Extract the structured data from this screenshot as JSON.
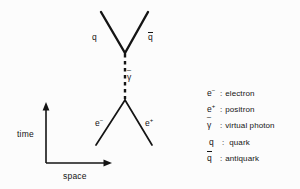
{
  "figure": {
    "type": "feynman-diagram",
    "background_color": "#fcfcfc",
    "line_color": "#141414"
  },
  "axes": {
    "vertical_label": "time",
    "horizontal_label": "space",
    "origin": {
      "x": 46,
      "y": 163
    },
    "vertical_tip": {
      "x": 46,
      "y": 104
    },
    "horizontal_tip": {
      "x": 111,
      "y": 163
    }
  },
  "diagram": {
    "upper_vertex": {
      "x": 125,
      "y": 53
    },
    "lower_vertex": {
      "x": 125,
      "y": 100
    },
    "legs": [
      {
        "name": "quark-leg",
        "label": "q",
        "from": {
          "x": 125,
          "y": 53
        },
        "to": {
          "x": 101,
          "y": 12
        }
      },
      {
        "name": "antiquark-leg",
        "label": "q",
        "overline": true,
        "from": {
          "x": 125,
          "y": 53
        },
        "to": {
          "x": 148,
          "y": 12
        }
      },
      {
        "name": "electron-leg",
        "label": "e",
        "charge": "-",
        "from": {
          "x": 125,
          "y": 100
        },
        "to": {
          "x": 96,
          "y": 145
        }
      },
      {
        "name": "positron-leg",
        "label": "e",
        "charge": "+",
        "from": {
          "x": 125,
          "y": 100
        },
        "to": {
          "x": 152,
          "y": 145
        }
      }
    ],
    "propagator": {
      "name": "virtual-photon-propagator",
      "style": "dashed",
      "label": "y",
      "tilde": true,
      "from": {
        "x": 125,
        "y": 53
      },
      "to": {
        "x": 125,
        "y": 100
      }
    }
  },
  "labels": {
    "quark": "q",
    "antiquark": "q",
    "electron": "e",
    "electron_charge": "−",
    "positron": "e",
    "positron_charge": "+",
    "virtual_photon": "γ"
  },
  "legend": {
    "rows": [
      {
        "symbol": "e",
        "charge": "−",
        "overline": false,
        "tilde": false,
        "separator": ":",
        "description": "electron"
      },
      {
        "symbol": "e",
        "charge": "+",
        "overline": false,
        "tilde": false,
        "separator": ":",
        "description": "positron"
      },
      {
        "symbol": "γ",
        "charge": "",
        "overline": false,
        "tilde": true,
        "separator": ":",
        "description": "virtual photon"
      },
      {
        "symbol": "q",
        "charge": "",
        "overline": false,
        "tilde": false,
        "separator": ":",
        "description": "quark"
      },
      {
        "symbol": "q",
        "charge": "",
        "overline": true,
        "tilde": false,
        "separator": ":",
        "description": "antiquark"
      }
    ]
  }
}
